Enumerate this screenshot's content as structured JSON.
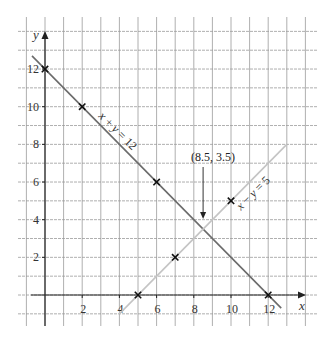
{
  "chart_data": {
    "type": "line",
    "title": "",
    "xlabel": "x",
    "ylabel": "y",
    "xlim": [
      -1,
      14
    ],
    "ylim": [
      -1,
      14
    ],
    "grid": true,
    "legend": "none (series labelled inline along lines)",
    "x_ticks": [
      2,
      4,
      6,
      8,
      10,
      12
    ],
    "y_ticks": [
      2,
      4,
      6,
      8,
      10,
      12
    ],
    "series": [
      {
        "name": "x + y = 12",
        "label_parts": [
          "x",
          " + ",
          "y",
          " = 12"
        ],
        "color": "#6b6b6b",
        "segment": [
          [
            -0.7,
            12.7
          ],
          [
            12.7,
            -0.7
          ]
        ],
        "points": [
          [
            0,
            12
          ],
          [
            2,
            10
          ],
          [
            6,
            6
          ],
          [
            12,
            0
          ]
        ],
        "label_pos": [
          118,
          131
        ],
        "label_angle": 45
      },
      {
        "name": "x − y = 5",
        "label_parts": [
          "x",
          " − ",
          "y",
          " = 5"
        ],
        "color": "#c4c4c4",
        "segment": [
          [
            4,
            -1
          ],
          [
            13,
            8
          ]
        ],
        "points": [
          [
            5,
            0
          ],
          [
            7,
            2
          ],
          [
            10,
            5
          ]
        ],
        "label_pos": [
          253,
          193
        ],
        "label_angle": -45
      }
    ],
    "annotations": [
      {
        "text": "(8.5, 3.5)",
        "point": [
          8.5,
          3.5
        ],
        "arrow": true,
        "label_pos": [
          213,
          161
        ]
      }
    ]
  },
  "colors": {
    "background": "#ffffff",
    "grid": "#9a9a9a",
    "axis": "#222222",
    "marker": "#111111"
  }
}
